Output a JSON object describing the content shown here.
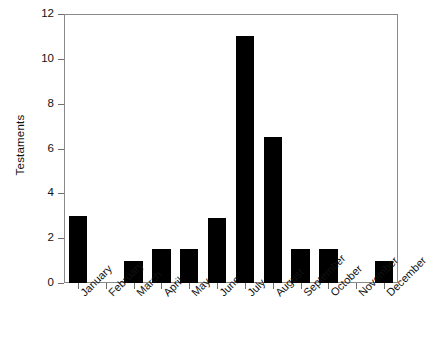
{
  "chart_data": {
    "type": "bar",
    "title": "",
    "xlabel": "",
    "ylabel": "Testaments",
    "categories": [
      "January",
      "February",
      "March",
      "April",
      "May",
      "June",
      "July",
      "August",
      "September",
      "October",
      "November",
      "December"
    ],
    "values": [
      3,
      0,
      1,
      1.5,
      1.5,
      2.9,
      11,
      6.5,
      1.5,
      1.5,
      0,
      1
    ],
    "ylim": [
      0,
      12
    ],
    "yticks": [
      0,
      2,
      4,
      6,
      8,
      10,
      12
    ],
    "ytick_labels": [
      "0",
      "2",
      "4",
      "6",
      "8",
      "10",
      "12"
    ],
    "grid": false,
    "legend": null,
    "bar_color": "#000000",
    "frame_color": "#8a8a8a",
    "background_color": "#ffffff",
    "xtick_label_rotation": -45
  }
}
